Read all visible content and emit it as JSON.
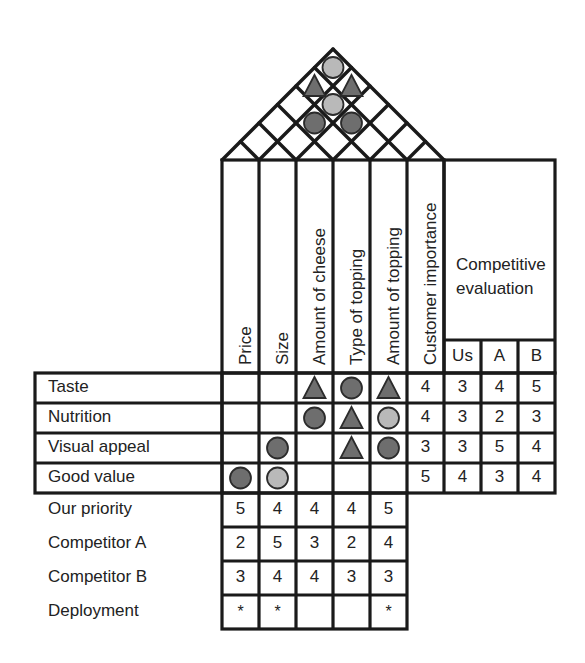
{
  "diagram": {
    "type": "house-of-quality"
  },
  "colors": {
    "line": "#1a1a1a",
    "symbol_dark": "#6e6e6e",
    "symbol_light": "#b9b9b9",
    "symbol_outline": "#2b2b2b",
    "background": "#ffffff"
  },
  "technical_columns": [
    {
      "id": "price",
      "label": "Price"
    },
    {
      "id": "size",
      "label": "Size"
    },
    {
      "id": "cheese",
      "label": "Amount of cheese"
    },
    {
      "id": "type_topping",
      "label": "Type of topping"
    },
    {
      "id": "amount_topping",
      "label": "Amount of topping"
    }
  ],
  "importance_column": {
    "id": "importance",
    "label": "Customer importance"
  },
  "competitive": {
    "title_line1": "Competitive",
    "title_line2": "evaluation",
    "columns": [
      {
        "id": "us",
        "label": "Us"
      },
      {
        "id": "a",
        "label": "A"
      },
      {
        "id": "b",
        "label": "B"
      }
    ]
  },
  "requirements": [
    {
      "label": "Taste",
      "relations": [
        "",
        "",
        "triangle-dark",
        "circle-dark",
        "triangle-dark"
      ],
      "importance": "4",
      "evaluation": [
        "3",
        "4",
        "5"
      ]
    },
    {
      "label": "Nutrition",
      "relations": [
        "",
        "",
        "circle-dark",
        "triangle-dark",
        "circle-light"
      ],
      "importance": "4",
      "evaluation": [
        "3",
        "2",
        "3"
      ]
    },
    {
      "label": "Visual appeal",
      "relations": [
        "",
        "circle-dark",
        "",
        "triangle-dark",
        "circle-dark"
      ],
      "importance": "3",
      "evaluation": [
        "3",
        "5",
        "4"
      ]
    },
    {
      "label": "Good value",
      "relations": [
        "circle-dark",
        "circle-light",
        "",
        "",
        ""
      ],
      "importance": "5",
      "evaluation": [
        "4",
        "3",
        "4"
      ]
    }
  ],
  "bottom_rows": [
    {
      "label": "Our priority",
      "values": [
        "5",
        "4",
        "4",
        "4",
        "5"
      ]
    },
    {
      "label": "Competitor A",
      "values": [
        "2",
        "5",
        "3",
        "2",
        "4"
      ]
    },
    {
      "label": "Competitor B",
      "values": [
        "3",
        "4",
        "4",
        "3",
        "3"
      ]
    },
    {
      "label": "Deployment",
      "values": [
        "*",
        "*",
        "",
        "",
        "*"
      ]
    }
  ],
  "roof": {
    "description": "Diagonal correlation lattice above the technical columns",
    "symbols": [
      {
        "level": 1,
        "slot": 3,
        "symbol": "circle-light"
      },
      {
        "level": 2,
        "slot": 2,
        "symbol": "triangle-dark"
      },
      {
        "level": 2,
        "slot": 3,
        "symbol": "triangle-dark"
      },
      {
        "level": 3,
        "slot": 2,
        "symbol": "circle-light"
      },
      {
        "level": 4,
        "slot": 1,
        "symbol": "circle-dark"
      },
      {
        "level": 4,
        "slot": 2,
        "symbol": "circle-dark"
      }
    ]
  }
}
